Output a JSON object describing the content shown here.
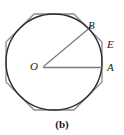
{
  "figure": {
    "caption": "(b)",
    "labels": {
      "center": "O",
      "vertex_b": "B",
      "point_e": "E",
      "point_a": "A"
    },
    "colors": {
      "circle_stroke": "#2b2b2b",
      "polygon_stroke": "#8c8c8c",
      "radius_stroke": "#7a7a7a",
      "label_text": "#1a1a1a",
      "background": "#ffffff"
    },
    "geometry": {
      "shape": "circle-with-circumscribed-regular-octagon",
      "center_x": 54,
      "center_y": 62,
      "circle_radius": 48,
      "polygon_sides": 8,
      "polygon_circumradius": 52,
      "polygon_rotation_deg": 22.5,
      "radius_to_b_angle_deg": -45,
      "radius_to_a_angle_deg": 0
    }
  }
}
